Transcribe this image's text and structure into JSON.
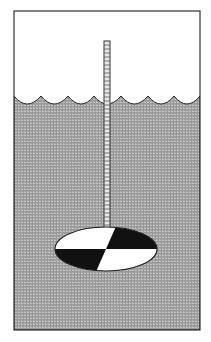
{
  "diagram": {
    "components": [
      {
        "id": "air",
        "label": ""
      },
      {
        "id": "water",
        "label": ""
      },
      {
        "id": "graduated-rod",
        "label": ""
      },
      {
        "id": "secchi-disk",
        "label": ""
      }
    ],
    "colors": {
      "background": "#ffffff",
      "water": "#9a9a9a",
      "water_texture": "#bdbdbd",
      "outline": "#2a2a2a",
      "disk_dark": "#111111",
      "disk_light": "#ffffff"
    }
  }
}
